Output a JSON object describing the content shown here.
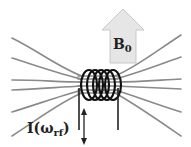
{
  "diagram": {
    "b0_label": {
      "main": "B",
      "subscript": "0"
    },
    "current_label": {
      "prefix": "I(",
      "omega": "ω",
      "subscript": "rf",
      "suffix": ")"
    },
    "icons": {
      "b0_arrow": "up-arrow-icon",
      "current_arrow": "double-headed-vertical-arrow-icon",
      "coil": "solenoid-coil-icon"
    },
    "colors": {
      "field_lines": "#8a8a8a",
      "coil": "#111111",
      "b0_arrow_fill": "#e6e6e6",
      "text": "#222222",
      "background": "#ffffff"
    },
    "field_line_count": 8,
    "coil_turns": 5
  }
}
